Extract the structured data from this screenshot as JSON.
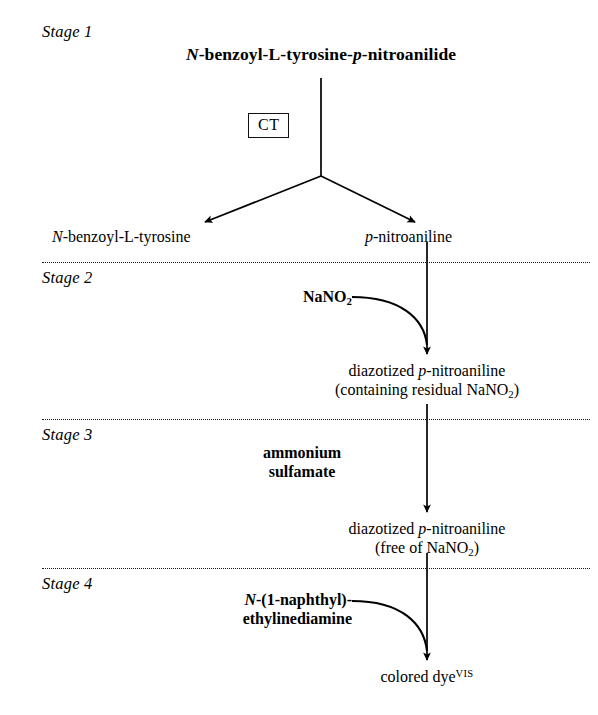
{
  "figure": {
    "kind": "reaction-scheme",
    "background_color": "#ffffff",
    "ink_color": "#000000"
  },
  "stages": [
    {
      "label": "Stage 1"
    },
    {
      "label": "Stage 2"
    },
    {
      "label": "Stage 3"
    },
    {
      "label": "Stage 4"
    }
  ],
  "stage1": {
    "substrate_prefix": "N",
    "substrate_mid": "-benzoyl-L-tyrosine-",
    "substrate_italic2": "p",
    "substrate_suffix": "-nitroanilide",
    "enzyme_box": "CT",
    "product_left_italic": "N",
    "product_left_rest": "-benzoyl-L-tyrosine",
    "product_right_italic": "p",
    "product_right_rest": "-nitroaniline"
  },
  "stage2": {
    "reagent_main": "NaNO",
    "reagent_sub": "2",
    "product_line1_a": "diazotized ",
    "product_line1_italic": "p",
    "product_line1_b": "-nitroaniline",
    "product_line2_a": "(containing residual NaNO",
    "product_line2_sub": "2",
    "product_line2_b": ")"
  },
  "stage3": {
    "reagent_line1": "ammonium",
    "reagent_line2": "sulfamate",
    "product_line1_a": "diazotized ",
    "product_line1_italic": "p",
    "product_line1_b": "-nitroaniline",
    "product_line2_a": "(free of NaNO",
    "product_line2_sub": "2",
    "product_line2_b": ")"
  },
  "stage4": {
    "reagent_italic": "N",
    "reagent_line1_rest": "-(1-naphthyl)-",
    "reagent_line2": "ethylinediamine",
    "product_text": "colored dye",
    "product_sup": "VIS"
  }
}
